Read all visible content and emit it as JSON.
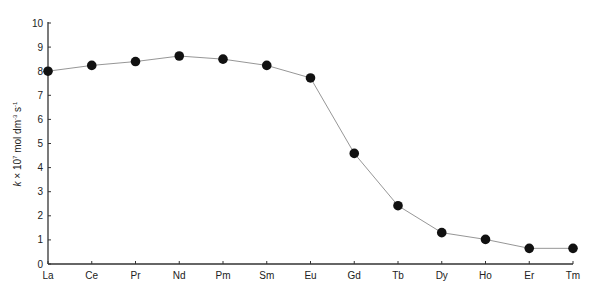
{
  "chart_data": {
    "type": "line",
    "title": "",
    "xlabel": "",
    "ylabel": "k × 10⁷ mol dm⁻³ s⁻¹",
    "ylabel_parts": {
      "k": "k",
      "times": " × 10",
      "exp1": "7",
      "unit1": " mol dm",
      "exp2": "-3",
      "unit2": " s",
      "exp3": "-1"
    },
    "categories": [
      "La",
      "Ce",
      "Pr",
      "Nd",
      "Pm",
      "Sm",
      "Eu",
      "Gd",
      "Tb",
      "Dy",
      "Ho",
      "Er",
      "Tm"
    ],
    "series": [
      {
        "name": "k",
        "values": [
          8.0,
          8.24,
          8.4,
          8.63,
          8.5,
          8.24,
          7.72,
          4.59,
          2.42,
          1.3,
          1.02,
          0.65,
          0.65
        ]
      }
    ],
    "ylim": [
      0,
      10
    ],
    "yticks": [
      0,
      1,
      2,
      3,
      4,
      5,
      6,
      7,
      8,
      9,
      10
    ],
    "grid": false,
    "legend": "none",
    "colors": {
      "line": "#8a8a8a",
      "marker": "#111111",
      "axis": "#333333"
    }
  }
}
